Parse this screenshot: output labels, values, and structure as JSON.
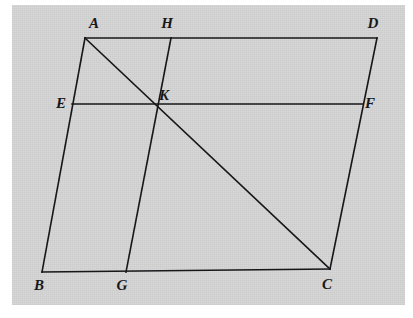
{
  "figure": {
    "kind": "geometry-diagram",
    "background_color": "#ffffff",
    "page_color": "#d7d7d7",
    "ink_color": "#17171a",
    "stroke_width": 1.6
  },
  "points": {
    "A": {
      "label": "A",
      "x": 85,
      "y": 38,
      "label_x": 94,
      "label_y": 28
    },
    "B": {
      "label": "B",
      "x": 42,
      "y": 272,
      "label_x": 39,
      "label_y": 290
    },
    "C": {
      "label": "C",
      "x": 330,
      "y": 269,
      "label_x": 327,
      "label_y": 289
    },
    "D": {
      "label": "D",
      "x": 377,
      "y": 38,
      "label_x": 373,
      "label_y": 28
    },
    "E": {
      "label": "E",
      "x": 72,
      "y": 104,
      "label_x": 61,
      "label_y": 108
    },
    "F": {
      "label": "F",
      "x": 363,
      "y": 104,
      "label_x": 370,
      "label_y": 108
    },
    "G": {
      "label": "G",
      "x": 126,
      "y": 272,
      "label_x": 122,
      "label_y": 290
    },
    "H": {
      "label": "H",
      "x": 171,
      "y": 38,
      "label_x": 167,
      "label_y": 28
    },
    "K": {
      "label": "K",
      "x": 157,
      "y": 105,
      "label_x": 164,
      "label_y": 100
    }
  },
  "segments": [
    {
      "name": "AD",
      "from": "A",
      "to": "D"
    },
    {
      "name": "AB",
      "from": "A",
      "to": "B"
    },
    {
      "name": "BC",
      "from": "B",
      "to": "C"
    },
    {
      "name": "DC",
      "from": "D",
      "to": "C"
    },
    {
      "name": "EF",
      "from": "E",
      "to": "F"
    },
    {
      "name": "HG",
      "from": "H",
      "to": "G"
    },
    {
      "name": "AC",
      "from": "A",
      "to": "C"
    }
  ],
  "labels_order": [
    "A",
    "H",
    "D",
    "E",
    "K",
    "F",
    "B",
    "G",
    "C"
  ]
}
